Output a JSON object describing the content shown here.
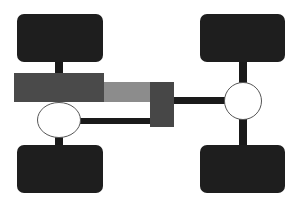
{
  "diagram": {
    "title": "",
    "colors": {
      "background": "#ffffff",
      "wheel": "#1e1e1e",
      "shaft": "#1a1a1a",
      "engine": "#4a4a4a",
      "transmission": "#8c8c8c",
      "transfer_case": "#474747",
      "differential_fill": "#ffffff",
      "differential_stroke": "#555555"
    },
    "components": [
      {
        "id": "wheel-front-left",
        "type": "wheel"
      },
      {
        "id": "wheel-front-right",
        "type": "wheel"
      },
      {
        "id": "wheel-rear-left",
        "type": "wheel"
      },
      {
        "id": "wheel-rear-right",
        "type": "wheel"
      },
      {
        "id": "engine",
        "type": "block"
      },
      {
        "id": "transmission",
        "type": "block"
      },
      {
        "id": "transfer-case",
        "type": "block"
      },
      {
        "id": "differential-left",
        "type": "ellipse"
      },
      {
        "id": "differential-right",
        "type": "circle"
      },
      {
        "id": "driveshaft-left",
        "type": "shaft"
      },
      {
        "id": "driveshaft-right",
        "type": "shaft"
      }
    ]
  }
}
